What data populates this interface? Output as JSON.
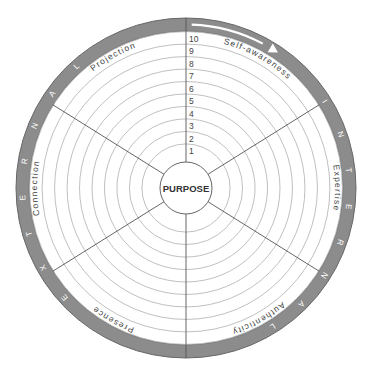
{
  "diagram": {
    "center_label": "PURPOSE",
    "scale_numbers": [
      "1",
      "2",
      "3",
      "4",
      "5",
      "6",
      "7",
      "8",
      "9",
      "10"
    ],
    "segments": [
      {
        "label": "Self-awareness",
        "start": 0,
        "end": 58
      },
      {
        "label": "Expertise",
        "start": 58,
        "end": 122
      },
      {
        "label": "Authenticity",
        "start": 122,
        "end": 180
      },
      {
        "label": "Presence",
        "start": 180,
        "end": 238
      },
      {
        "label": "Connection",
        "start": 238,
        "end": 302
      },
      {
        "label": "Projection",
        "start": 302,
        "end": 360
      }
    ],
    "band_labels": {
      "internal": "INTERNAL",
      "external": "EXTERNAL"
    },
    "colors": {
      "band": "#8c8c8c",
      "band_text": "#ffffff",
      "ring": "#b0b0b0",
      "spoke": "#555555",
      "text": "#444444",
      "arrow": "#ffffff"
    }
  }
}
